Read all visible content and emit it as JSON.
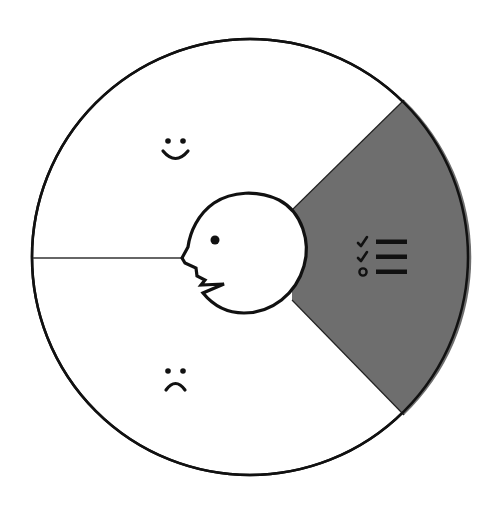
{
  "diagram": {
    "title": "",
    "colors": {
      "background": "#ffffff",
      "stroke": "#111111",
      "highlight_segment": "#6e6e6e",
      "face_fill": "#ffffff"
    },
    "outer_circle": {
      "cx": 250,
      "cy": 257,
      "r": 218
    },
    "inner_face": {
      "cx": 245,
      "cy": 254,
      "r": 61
    },
    "segments": [
      {
        "id": "positive",
        "icon": "smiley-face-icon",
        "label": "",
        "shaded": false
      },
      {
        "id": "negative",
        "icon": "frowny-face-icon",
        "label": "",
        "shaded": false
      },
      {
        "id": "checklist",
        "icon": "checklist-icon",
        "label": "",
        "shaded": true
      }
    ]
  }
}
